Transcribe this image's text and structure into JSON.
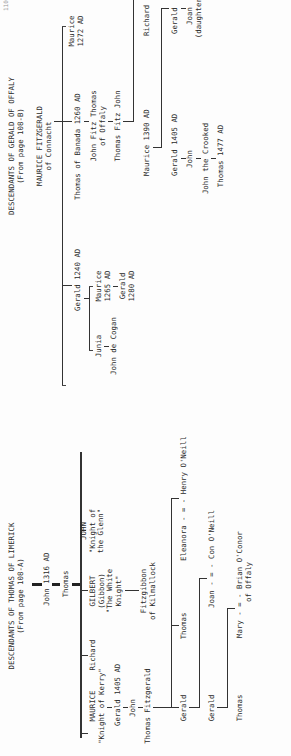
{
  "page_number": "110",
  "gerald_tree": {
    "title": "DESCENDANTS OF GERALD OF OFFALY",
    "subtitle": "(From page 108-B)",
    "root": {
      "name": "MAURICE FITZGERALD",
      "sub": "of Connacht"
    },
    "gerald_1240": "Gerald  1240 AD",
    "junia": "Junia",
    "john_de_cogan": "John de Cogan",
    "maurice_1265": {
      "name": "Maurice",
      "year": "1265 AD"
    },
    "gerald_1280": {
      "name": "Gerald",
      "year": "1280 AD"
    },
    "thomas_banada": "Thomas of Banada  1260 AD",
    "john_fitz_thomas": {
      "name": "John Fitz Thomas",
      "sub": "of Offaly"
    },
    "thomas_fitz_john": "Thomas Fitz John",
    "maurice_1390": "Maurice  1390 AD",
    "richard": "Richard",
    "gerald_1405": "Gerald  1405 AD",
    "gerald_b": "Gerald",
    "john": "John",
    "joan": {
      "name": "Joan",
      "sub": "(daughter)"
    },
    "john_crooked": "John the Crooked",
    "thomas_1477": "Thomas 1477 AD",
    "maurice_1272": {
      "name": "Maurice",
      "year": "1272 AD"
    }
  },
  "thomas_tree": {
    "title": "DESCENDANTS OF THOMAS OF LIMERICK",
    "subtitle": "(From page 108-A)",
    "john_1316": "John  1316 AD",
    "thomas": "Thomas",
    "maurice": {
      "name": "MAURICE",
      "sub": "\"Knight of Kerry\""
    },
    "gerald_1405": "Gerald  1405 AD",
    "john": "John",
    "thomas_fitzgerald": "Thomas Fitzgerald",
    "richard": "Richard",
    "gilbert": {
      "name": "GILBERT",
      "l2": "(Gibbon)",
      "l3": "\"The White",
      "l4": "Knight\""
    },
    "fitzgibbon": {
      "name": "Fitzgibbon",
      "sub": "of Kilmallock"
    },
    "john_glenn": {
      "name": "JOHN",
      "l2": "\"Knight of",
      "l3": "the Glenn\""
    },
    "gerald_1": "Gerald",
    "thomas_2": "Thomas",
    "eleanora": "Eleanora - = - Henry O'Neill",
    "gerald_2": "Gerald",
    "joan_con": "Joan - = - Con O'Neill",
    "thomas_3": "Thomas",
    "mary_brian": {
      "name": "Mary - = - Brian O'Conor",
      "sub": "of Offaly"
    }
  }
}
